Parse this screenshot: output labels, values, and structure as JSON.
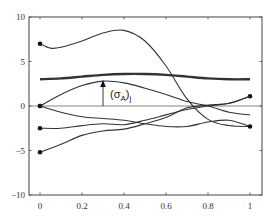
{
  "chart_data": {
    "type": "line",
    "title": "",
    "xlabel": "",
    "ylabel": "",
    "xlim": [
      0,
      1
    ],
    "ylim": [
      -10,
      10
    ],
    "grid": false,
    "legend": null,
    "x_ticks": [
      "0",
      "0.2",
      "0.4",
      "0.6",
      "0.8",
      "1"
    ],
    "y_ticks": [
      "10",
      "5",
      "0",
      "-5",
      "-10"
    ],
    "zero_line": true,
    "annotation": {
      "text_main": "(σ",
      "text_sub": "A",
      "text_close": ")",
      "text_subj": "j",
      "arrow_x": 0.3,
      "arrow_from": 0,
      "arrow_to": 2.8
    },
    "series": [
      {
        "name": "envelope",
        "style": "thick",
        "x": [
          0,
          0.1,
          0.2,
          0.3,
          0.4,
          0.5,
          0.6,
          0.7,
          0.8,
          0.9,
          1.0
        ],
        "values": [
          3.0,
          3.1,
          3.3,
          3.5,
          3.6,
          3.6,
          3.5,
          3.3,
          3.1,
          3.0,
          3.0
        ]
      },
      {
        "name": "curve-1",
        "marker_start": true,
        "x": [
          0,
          0.05,
          0.1,
          0.2,
          0.3,
          0.4,
          0.5,
          0.6,
          0.7,
          0.8,
          0.9,
          1.0
        ],
        "values": [
          7.0,
          6.5,
          6.6,
          7.3,
          8.2,
          8.5,
          7.3,
          4.5,
          0.8,
          -1.5,
          -2.2,
          -2.3
        ]
      },
      {
        "name": "curve-2",
        "marker_start": true,
        "x": [
          0,
          0.1,
          0.2,
          0.3,
          0.4,
          0.5,
          0.6,
          0.7,
          0.8,
          0.9,
          1.0
        ],
        "values": [
          0,
          1.3,
          2.3,
          2.8,
          2.6,
          2.0,
          1.3,
          0.5,
          0,
          -0.7,
          -1.0
        ]
      },
      {
        "name": "curve-3",
        "marker_start": true,
        "marker_end": true,
        "x": [
          0,
          0.1,
          0.2,
          0.3,
          0.4,
          0.5,
          0.6,
          0.7,
          0.8,
          0.9,
          1.0
        ],
        "values": [
          0,
          -0.7,
          -1.2,
          -1.4,
          -1.6,
          -2.0,
          -2.3,
          -2.3,
          -1.8,
          -1.6,
          -2.3
        ]
      },
      {
        "name": "curve-4",
        "marker_start": true,
        "marker_end": true,
        "x": [
          0,
          0.1,
          0.2,
          0.3,
          0.4,
          0.5,
          0.6,
          0.7,
          0.8,
          0.9,
          1.0
        ],
        "values": [
          -2.5,
          -2.5,
          -2.2,
          -2.0,
          -2.1,
          -1.6,
          -1.0,
          -0.4,
          0,
          0.3,
          1.1
        ]
      },
      {
        "name": "curve-5",
        "marker_start": true,
        "x": [
          0,
          0.1,
          0.2,
          0.3,
          0.4,
          0.5,
          0.6,
          0.7,
          0.8,
          0.9,
          1.0
        ],
        "values": [
          -5.2,
          -4.3,
          -3.3,
          -2.8,
          -2.6,
          -2.0,
          -1.3,
          -0.2,
          0.1,
          0.3,
          1.1
        ]
      }
    ]
  }
}
